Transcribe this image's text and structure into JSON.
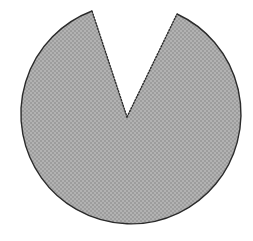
{
  "figure": {
    "name": "pac-man-circle-with-wedge-cut",
    "background_color": "#ffffff",
    "canvas": {
      "width": 253,
      "height": 241
    },
    "shape": {
      "type": "circle-with-sector-removed",
      "fill_color": "#a8a8a8",
      "outline_color": "#2b2b2b",
      "outline_width": 1.4,
      "center": {
        "x": 127,
        "y": 117
      },
      "radius": 110,
      "wedge": {
        "apex": {
          "x": 127,
          "y": 117
        },
        "left_vertex": {
          "x": 92,
          "y": 11
        },
        "right_vertex": {
          "x": 177,
          "y": 14
        },
        "opening_direction": "up",
        "approx_angle_degrees": 45,
        "edge_style": "dotted"
      },
      "arc": {
        "start_point": {
          "x": 177,
          "y": 14
        },
        "end_point": {
          "x": 92,
          "y": 11
        },
        "sweep": "clockwise-major-arc",
        "large_arc": true
      }
    },
    "texture": {
      "type": "dither-checker",
      "light_color": "#b4b4b4",
      "dark_color": "#9c9c9c",
      "cell_size": 2
    }
  }
}
